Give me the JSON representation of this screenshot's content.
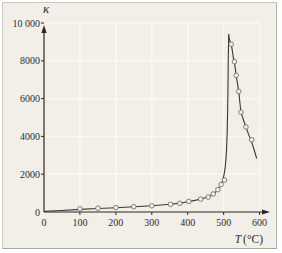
{
  "chart_data": {
    "type": "scatter",
    "title": "",
    "xlabel": "T (°C)",
    "ylabel": "κ",
    "xlim": [
      0,
      620
    ],
    "ylim": [
      0,
      10400
    ],
    "x_ticks": [
      0,
      100,
      200,
      300,
      400,
      500,
      600
    ],
    "x_tick_labels": [
      "0",
      "100",
      "200",
      "300",
      "400",
      "500",
      "600"
    ],
    "y_ticks": [
      0,
      2000,
      4000,
      6000,
      8000,
      10000
    ],
    "y_tick_labels": [
      "0",
      "2000",
      "4000",
      "6000",
      "8000",
      "10 000"
    ],
    "grid": true,
    "legend": "none",
    "series": [
      {
        "name": "fitted-curve",
        "type": "line",
        "points": [
          [
            0,
            30
          ],
          [
            50,
            80
          ],
          [
            100,
            140
          ],
          [
            150,
            185
          ],
          [
            200,
            225
          ],
          [
            250,
            275
          ],
          [
            300,
            335
          ],
          [
            350,
            415
          ],
          [
            380,
            470
          ],
          [
            400,
            545
          ],
          [
            420,
            615
          ],
          [
            440,
            705
          ],
          [
            455,
            795
          ],
          [
            468,
            915
          ],
          [
            478,
            1060
          ],
          [
            486,
            1230
          ],
          [
            492,
            1430
          ],
          [
            497,
            1660
          ],
          [
            501,
            1960
          ],
          [
            504,
            2320
          ],
          [
            506,
            2680
          ],
          [
            508,
            3250
          ],
          [
            510,
            4250
          ],
          [
            511,
            5250
          ],
          [
            512,
            6600
          ],
          [
            513,
            8200
          ],
          [
            514,
            9400
          ],
          [
            516,
            9150
          ],
          [
            519,
            8950
          ],
          [
            521,
            8880
          ],
          [
            524,
            8550
          ],
          [
            527,
            8150
          ],
          [
            530,
            7940
          ],
          [
            535,
            7230
          ],
          [
            542,
            6380
          ],
          [
            548,
            5300
          ],
          [
            555,
            4880
          ],
          [
            562,
            4500
          ],
          [
            570,
            4080
          ],
          [
            578,
            3700
          ],
          [
            585,
            3280
          ],
          [
            592,
            2820
          ]
        ]
      },
      {
        "name": "measured-points",
        "type": "scatter",
        "marker": "open-circle",
        "points": [
          [
            100,
            170
          ],
          [
            150,
            200
          ],
          [
            200,
            235
          ],
          [
            250,
            280
          ],
          [
            300,
            330
          ],
          [
            352,
            405
          ],
          [
            378,
            455
          ],
          [
            403,
            560
          ],
          [
            436,
            680
          ],
          [
            457,
            790
          ],
          [
            471,
            950
          ],
          [
            484,
            1180
          ],
          [
            493,
            1450
          ],
          [
            502,
            1690
          ],
          [
            521,
            8880
          ],
          [
            530,
            7950
          ],
          [
            535,
            7230
          ],
          [
            542,
            6380
          ],
          [
            548,
            5280
          ],
          [
            562,
            4500
          ],
          [
            578,
            3820
          ]
        ]
      }
    ]
  },
  "labels": {
    "x_symbol": "T",
    "x_unit": "(°C)"
  },
  "colors": {
    "panel_bg": "#f2efe9",
    "frame": "#ccc9c4",
    "grid": "#fbf9f5",
    "axis": "#2a2826",
    "curve": "#3a3835",
    "marker_stroke": "#72706c",
    "marker_fill": "#f4f2ed",
    "text": "#2e2c29"
  }
}
